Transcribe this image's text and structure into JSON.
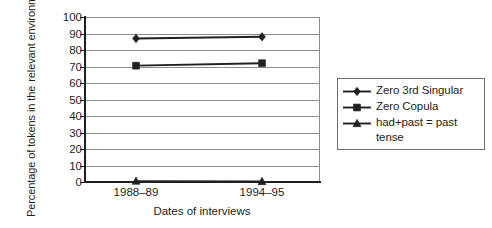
{
  "chart_data": {
    "type": "line",
    "title": "",
    "xlabel": "Dates of interviews",
    "ylabel": "Percentage of tokens in the relevant environment",
    "ylabel_lines": [
      "Percentage of tokens in the",
      "relevant environment"
    ],
    "categories": [
      "1988–89",
      "1994–95"
    ],
    "ylim": [
      0,
      100
    ],
    "ytick_step": 10,
    "yticks": [
      100,
      90,
      80,
      70,
      60,
      50,
      40,
      30,
      20,
      10,
      0
    ],
    "grid": "horizontal",
    "legend_position": "right",
    "series": [
      {
        "name": "Zero 3rd Singular",
        "marker": "diamond",
        "values": [
          87,
          88
        ]
      },
      {
        "name": "Zero Copula",
        "marker": "square",
        "values": [
          70.5,
          72
        ]
      },
      {
        "name": "had+past = past tense",
        "marker": "triangle",
        "values": [
          0.5,
          0.3
        ]
      }
    ],
    "colors": {
      "line": "#231f20",
      "marker": "#231f20",
      "grid": "#8d8d8d",
      "axis": "#231f20",
      "background": "#ffffff",
      "legend_border": "#6f6f6f"
    }
  },
  "legend": {
    "items": [
      {
        "label": "Zero 3rd Singular",
        "marker": "diamond-marker-icon"
      },
      {
        "label": "Zero Copula",
        "marker": "square-marker-icon"
      },
      {
        "label": "had+past = past\ntense",
        "marker": "triangle-marker-icon"
      }
    ]
  }
}
